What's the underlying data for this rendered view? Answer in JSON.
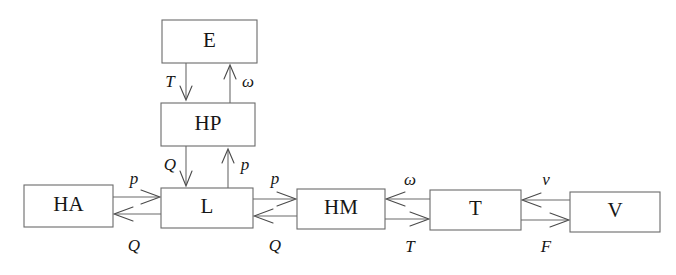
{
  "diagram": {
    "type": "block-diagram",
    "background_color": "#ffffff",
    "line_color": "#6b6b6b",
    "text_color": "#161616",
    "nodes": [
      {
        "id": "E",
        "label": "E",
        "x": 162,
        "y": 20,
        "w": 95,
        "h": 43
      },
      {
        "id": "HP",
        "label": "HP",
        "x": 161,
        "y": 103,
        "w": 94,
        "h": 43
      },
      {
        "id": "HA",
        "label": "HA",
        "x": 24,
        "y": 185,
        "w": 89,
        "h": 42
      },
      {
        "id": "L",
        "label": "L",
        "x": 161,
        "y": 188,
        "w": 92,
        "h": 40
      },
      {
        "id": "HM",
        "label": "HM",
        "x": 297,
        "y": 189,
        "w": 88,
        "h": 40
      },
      {
        "id": "T",
        "label": "T",
        "x": 430,
        "y": 190,
        "w": 91,
        "h": 40
      },
      {
        "id": "V",
        "label": "V",
        "x": 570,
        "y": 192,
        "w": 90,
        "h": 40
      }
    ],
    "edges": [
      {
        "id": "e-hp-down",
        "from": "E",
        "to": "HP",
        "label": "T",
        "orientation": "vertical",
        "direction": "down",
        "label_x": 170,
        "label_y": 83,
        "label_side": "left"
      },
      {
        "id": "hp-e-up",
        "from": "HP",
        "to": "E",
        "label": "ω",
        "orientation": "vertical",
        "direction": "up",
        "label_x": 248,
        "label_y": 83,
        "label_side": "right"
      },
      {
        "id": "hp-l-down",
        "from": "HP",
        "to": "L",
        "label": "Q",
        "orientation": "vertical",
        "direction": "down",
        "label_x": 170,
        "label_y": 166,
        "label_side": "left"
      },
      {
        "id": "l-hp-up",
        "from": "L",
        "to": "HP",
        "label": "p",
        "orientation": "vertical",
        "direction": "up",
        "label_x": 245,
        "label_y": 166,
        "label_side": "right"
      },
      {
        "id": "ha-l-right",
        "from": "HA",
        "to": "L",
        "label": "p",
        "orientation": "horizontal",
        "direction": "right",
        "label_x": 134,
        "label_y": 180,
        "label_side": "top"
      },
      {
        "id": "l-ha-left",
        "from": "L",
        "to": "HA",
        "label": "Q",
        "orientation": "horizontal",
        "direction": "left",
        "label_x": 134,
        "label_y": 247,
        "label_side": "bottom"
      },
      {
        "id": "l-hm-right",
        "from": "L",
        "to": "HM",
        "label": "p",
        "orientation": "horizontal",
        "direction": "right",
        "label_x": 275,
        "label_y": 180,
        "label_side": "top"
      },
      {
        "id": "hm-l-left",
        "from": "HM",
        "to": "L",
        "label": "Q",
        "orientation": "horizontal",
        "direction": "left",
        "label_x": 275,
        "label_y": 247,
        "label_side": "bottom"
      },
      {
        "id": "t-hm-left",
        "from": "T",
        "to": "HM",
        "label": "ω",
        "orientation": "horizontal",
        "direction": "left",
        "label_x": 410,
        "label_y": 181,
        "label_side": "top"
      },
      {
        "id": "hm-t-right",
        "from": "HM",
        "to": "T",
        "label": "T",
        "orientation": "horizontal",
        "direction": "right",
        "label_x": 410,
        "label_y": 248,
        "label_side": "bottom"
      },
      {
        "id": "v-t-left",
        "from": "V",
        "to": "T",
        "label": "v",
        "orientation": "horizontal",
        "direction": "left",
        "label_x": 546,
        "label_y": 181,
        "label_side": "top"
      },
      {
        "id": "t-v-right",
        "from": "T",
        "to": "V",
        "label": "F",
        "orientation": "horizontal",
        "direction": "right",
        "label_x": 546,
        "label_y": 248,
        "label_side": "bottom"
      }
    ]
  }
}
